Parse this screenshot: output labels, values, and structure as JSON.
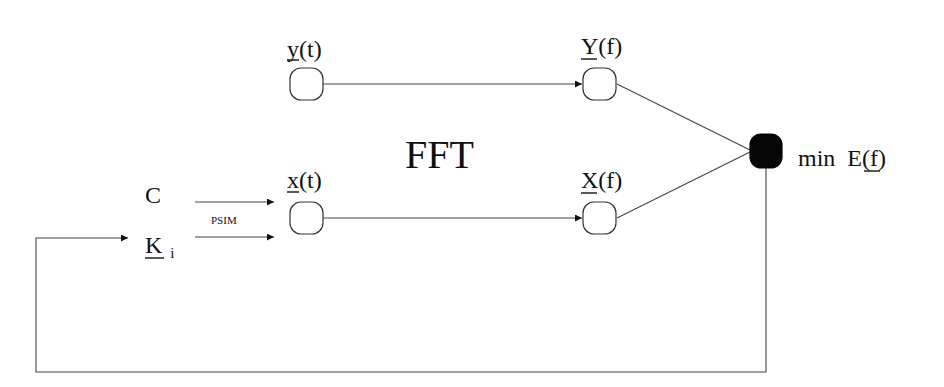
{
  "diagram": {
    "title": "FFT",
    "nodes": {
      "y_t": {
        "label_base": "y",
        "label_rest": "(t)"
      },
      "Y_f": {
        "label_base": "Y",
        "label_rest": "(f)"
      },
      "x_t": {
        "label_base": "x",
        "label_rest": "(t)"
      },
      "X_f": {
        "label_base": "X",
        "label_rest": "(f)"
      },
      "E_f": {
        "prefix": "min",
        "label_base": "E",
        "label_rest": "(f)"
      }
    },
    "inputs": {
      "C": {
        "label": "C"
      },
      "K": {
        "label_base": "K",
        "subscript": "i"
      }
    },
    "edge_labels": {
      "psim": "PSIM"
    },
    "colors": {
      "line": "#444444",
      "node_fill": "#ffffff",
      "node_filled": "#050505",
      "text": "#111111"
    }
  }
}
